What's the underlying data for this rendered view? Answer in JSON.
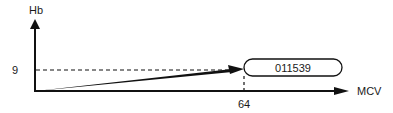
{
  "diagram": {
    "y_axis_label": "Hb",
    "x_axis_label": "MCV",
    "y_tick_label": "9",
    "x_tick_label": "64",
    "point_label": "011539",
    "colors": {
      "stroke": "#111111",
      "background": "#ffffff"
    }
  }
}
